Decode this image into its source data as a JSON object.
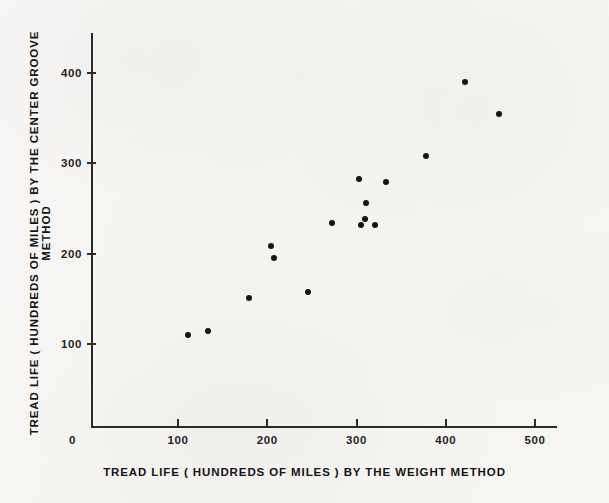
{
  "chart_data": {
    "type": "scatter",
    "title": "",
    "xlabel": "TREAD LIFE ( HUNDREDS OF MILES ) BY THE WEIGHT METHOD",
    "ylabel": "TREAD LIFE ( HUNDREDS OF MILES ) BY THE CENTER GROOVE METHOD",
    "xlim": [
      0,
      520
    ],
    "ylim": [
      0,
      435
    ],
    "xticks": [
      0,
      100,
      200,
      300,
      400,
      500
    ],
    "yticks": [
      100,
      200,
      300,
      400
    ],
    "xticklabels": [
      "0",
      "100",
      "200",
      "300",
      "400",
      "500"
    ],
    "yticklabels": [
      "100",
      "200",
      "300",
      "400"
    ],
    "origin_label": "0",
    "grid": false,
    "legend": null,
    "marker": "filled-circle",
    "marker_color": "#141414",
    "points": [
      {
        "x": 111,
        "y": 110
      },
      {
        "x": 134,
        "y": 114
      },
      {
        "x": 180,
        "y": 151
      },
      {
        "x": 204,
        "y": 208
      },
      {
        "x": 208,
        "y": 195
      },
      {
        "x": 246,
        "y": 158
      },
      {
        "x": 272,
        "y": 234
      },
      {
        "x": 303,
        "y": 283
      },
      {
        "x": 311,
        "y": 256
      },
      {
        "x": 310,
        "y": 238
      },
      {
        "x": 305,
        "y": 232
      },
      {
        "x": 321,
        "y": 232
      },
      {
        "x": 333,
        "y": 279
      },
      {
        "x": 378,
        "y": 308
      },
      {
        "x": 422,
        "y": 390
      },
      {
        "x": 460,
        "y": 355
      }
    ]
  }
}
